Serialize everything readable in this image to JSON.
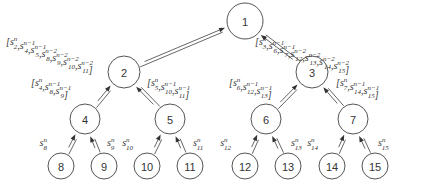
{
  "diagram": {
    "type": "binary-tree-aggregation",
    "nodes": [
      {
        "id": 1,
        "label": "1"
      },
      {
        "id": 2,
        "label": "2"
      },
      {
        "id": 3,
        "label": "3"
      },
      {
        "id": 4,
        "label": "4"
      },
      {
        "id": 5,
        "label": "5"
      },
      {
        "id": 6,
        "label": "6"
      },
      {
        "id": 7,
        "label": "7"
      },
      {
        "id": 8,
        "label": "8"
      },
      {
        "id": 9,
        "label": "9"
      },
      {
        "id": 10,
        "label": "10"
      },
      {
        "id": 11,
        "label": "11"
      },
      {
        "id": 12,
        "label": "12"
      },
      {
        "id": 13,
        "label": "13"
      },
      {
        "id": 14,
        "label": "14"
      },
      {
        "id": 15,
        "label": "15"
      }
    ],
    "edges": [
      {
        "from": 2,
        "to": 1,
        "message": [
          [
            "2",
            "n"
          ],
          [
            "4",
            "n−1"
          ],
          [
            "5",
            "n−1"
          ],
          [
            "8",
            "n−2"
          ],
          [
            "9",
            "n−2"
          ],
          [
            "10",
            "n−2"
          ],
          [
            "11",
            "n−2"
          ]
        ]
      },
      {
        "from": 3,
        "to": 1,
        "message": [
          [
            "3",
            "n"
          ],
          [
            "6",
            "n−1"
          ],
          [
            "7",
            "n−1"
          ],
          [
            "12",
            "n−2"
          ],
          [
            "13",
            "n−2"
          ],
          [
            "14",
            "n−2"
          ],
          [
            "15",
            "n−2"
          ]
        ]
      },
      {
        "from": 4,
        "to": 2,
        "message": [
          [
            "4",
            "n"
          ],
          [
            "8",
            "n−1"
          ],
          [
            "9",
            "n−1"
          ]
        ]
      },
      {
        "from": 5,
        "to": 2,
        "message": [
          [
            "5",
            "n"
          ],
          [
            "10",
            "n−1"
          ],
          [
            "11",
            "n−1"
          ]
        ]
      },
      {
        "from": 6,
        "to": 3,
        "message": [
          [
            "6",
            "n"
          ],
          [
            "12",
            "n−1"
          ],
          [
            "13",
            "n−1"
          ]
        ]
      },
      {
        "from": 7,
        "to": 3,
        "message": [
          [
            "7",
            "n"
          ],
          [
            "14",
            "n−1"
          ],
          [
            "15",
            "n−1"
          ]
        ]
      },
      {
        "from": 8,
        "to": 4,
        "message": [
          [
            "8",
            "n"
          ]
        ]
      },
      {
        "from": 9,
        "to": 4,
        "message": [
          [
            "9",
            "n"
          ]
        ]
      },
      {
        "from": 10,
        "to": 5,
        "message": [
          [
            "10",
            "n"
          ]
        ]
      },
      {
        "from": 11,
        "to": 5,
        "message": [
          [
            "11",
            "n"
          ]
        ]
      },
      {
        "from": 12,
        "to": 6,
        "message": [
          [
            "12",
            "n"
          ]
        ]
      },
      {
        "from": 13,
        "to": 6,
        "message": [
          [
            "13",
            "n"
          ]
        ]
      },
      {
        "from": 14,
        "to": 7,
        "message": [
          [
            "14",
            "n"
          ]
        ]
      },
      {
        "from": 15,
        "to": 7,
        "message": [
          [
            "15",
            "n"
          ]
        ]
      }
    ],
    "symbol": "s"
  }
}
